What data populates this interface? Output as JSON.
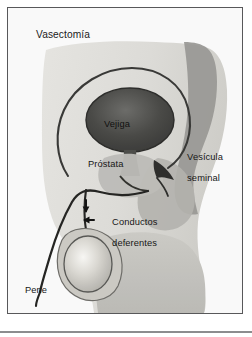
{
  "figure": {
    "title": "Vasectomía",
    "type": "medical-illustration",
    "style": "grayscale halftone drawing with thin dark frame"
  },
  "labels": {
    "bladder": "Vejiga",
    "seminal_vesicle_line1": "Vesícula",
    "seminal_vesicle_line2": "seminal",
    "prostate": "Próstata",
    "vas_deferens_line1": "Conductos",
    "vas_deferens_line2": "deferentes",
    "penis": "Pene"
  },
  "icons": {
    "marker_upper": "arrow-marker-icon",
    "marker_lower": "arrow-marker-icon"
  },
  "colors": {
    "frame_border": "#58585a",
    "page_background": "#ffffff",
    "body_light": "#e4e3df",
    "body_mid": "#c9c8c3",
    "bone_gray": "#9a9a98",
    "bladder_dark": "#4a4a48",
    "duct_stroke": "#2b2b2b",
    "text": "#171717",
    "testicle_highlight": "#f4f3ef"
  }
}
